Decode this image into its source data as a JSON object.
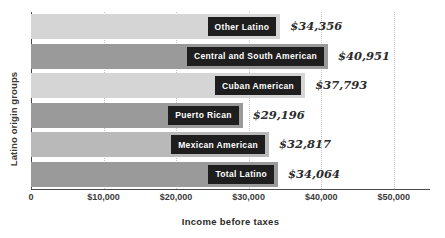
{
  "chart_data": {
    "type": "bar",
    "orientation": "horizontal",
    "title": "",
    "xlabel": "Income before taxes",
    "ylabel": "Latino origin groups",
    "xlim": [
      0,
      55000
    ],
    "grid": true,
    "legend": "none",
    "xticks": [
      {
        "label": "0",
        "value": 0
      },
      {
        "label": "$10,000",
        "value": 10000
      },
      {
        "label": "$20,000",
        "value": 20000
      },
      {
        "label": "$30,000",
        "value": 30000
      },
      {
        "label": "$40,000",
        "value": 40000
      },
      {
        "label": "$50,000",
        "value": 50000
      }
    ],
    "categories": [
      "Other Latino",
      "Central and South American",
      "Cuban American",
      "Puerto Rican",
      "Mexican American",
      "Total Latino"
    ],
    "values": [
      34356,
      40951,
      37793,
      29196,
      32817,
      34064
    ],
    "value_labels": [
      "$34,356",
      "$40,951",
      "$37,793",
      "$29,196",
      "$32,817",
      "$34,064"
    ],
    "bars": [
      {
        "category": "Other Latino",
        "value": 34356,
        "value_label": "$34,356",
        "color": "#d5d5d5"
      },
      {
        "category": "Central and South American",
        "value": 40951,
        "value_label": "$40,951",
        "color": "#9a9a9a"
      },
      {
        "category": "Cuban American",
        "value": 37793,
        "value_label": "$37,793",
        "color": "#d5d5d5"
      },
      {
        "category": "Puerto Rican",
        "value": 29196,
        "value_label": "$29,196",
        "color": "#9a9a9a"
      },
      {
        "category": "Mexican American",
        "value": 32817,
        "value_label": "$32,817",
        "color": "#b9b9b9"
      },
      {
        "category": "Total Latino",
        "value": 34064,
        "value_label": "$34,064",
        "color": "#9a9a9a"
      }
    ]
  },
  "colors": {
    "bar_light": "#d5d5d5",
    "bar_mid": "#b9b9b9",
    "bar_dark": "#9a9a9a",
    "label_box": "#1e1e1e",
    "label_text": "#ffffff",
    "axis": "#4a4a4a",
    "gridline": "#c2c2c2",
    "text": "#2b2b2b",
    "background": "#ffffff"
  }
}
